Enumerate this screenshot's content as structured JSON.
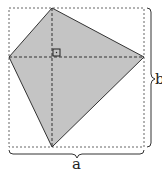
{
  "diagram": {
    "type": "kite inscribed in rectangle",
    "labels": {
      "width": "a",
      "height": "b"
    },
    "colors": {
      "fill": "#c4c4c4",
      "stroke": "#333333",
      "dashed": "#555555",
      "background": "#ffffff"
    },
    "rectangle": {
      "x": 9,
      "y": 8,
      "width": 135,
      "height": 139
    },
    "kite_vertices": {
      "top": [
        52,
        8
      ],
      "right": [
        144,
        57
      ],
      "bottom": [
        52,
        147
      ],
      "left": [
        9,
        57
      ]
    },
    "diagonals_intersection": [
      52,
      57
    ],
    "right_angle_marker": true
  }
}
